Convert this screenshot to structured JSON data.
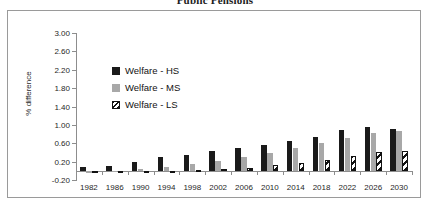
{
  "title": "Public Pensions",
  "legend": {
    "position": "inside-top-left",
    "items": [
      {
        "label": "Welfare - HS",
        "key": "hs",
        "color": "#1a1a1a",
        "pattern": "solid"
      },
      {
        "label": "Welfare - MS",
        "key": "ms",
        "color": "#a8a8a8",
        "pattern": "solid"
      },
      {
        "label": "Welfare - LS",
        "key": "ls",
        "color": "#111111",
        "pattern": "diagonal-hatch"
      }
    ]
  },
  "axes": {
    "ylabel": "% difference",
    "xlabel": "",
    "yticks": [
      "3.00",
      "2.60",
      "2.20",
      "1.80",
      "1.40",
      "1.00",
      "0.60",
      "0.20",
      "-0.20"
    ],
    "ymin": -0.2,
    "ymax": 3.0,
    "ystep": 0.4
  },
  "chart_data": {
    "type": "bar",
    "title": "Public Pensions",
    "xlabel": "",
    "ylabel": "% difference",
    "ylim": [
      -0.2,
      3.0
    ],
    "ytick_step": 0.4,
    "grid": false,
    "legend_position": "inside-top-left",
    "categories": [
      "1982",
      "1986",
      "1990",
      "1994",
      "1998",
      "2002",
      "2006",
      "2010",
      "2014",
      "2018",
      "2022",
      "2026",
      "2030"
    ],
    "series": [
      {
        "name": "Welfare - HS",
        "color": "#1a1a1a",
        "values": [
          0.08,
          0.1,
          0.2,
          0.3,
          0.35,
          0.43,
          0.5,
          0.56,
          0.65,
          0.74,
          0.88,
          0.95,
          0.92
        ]
      },
      {
        "name": "Welfare - MS",
        "color": "#a8a8a8",
        "values": [
          -0.04,
          -0.02,
          0.04,
          0.09,
          0.14,
          0.22,
          0.3,
          0.38,
          0.5,
          0.6,
          0.72,
          0.82,
          0.86
        ]
      },
      {
        "name": "Welfare - LS",
        "color": "#111111",
        "pattern": "diagonal-hatch",
        "values": [
          -0.03,
          -0.03,
          -0.02,
          0.0,
          0.02,
          0.04,
          0.07,
          0.12,
          0.18,
          0.24,
          0.33,
          0.4,
          0.43
        ]
      }
    ]
  }
}
